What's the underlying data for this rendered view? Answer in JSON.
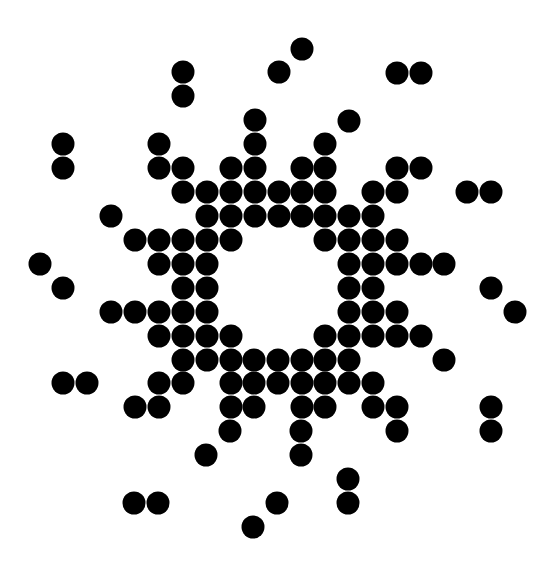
{
  "figure": {
    "width": 554,
    "height": 561,
    "background": "#ffffff",
    "dot_color": "#000000",
    "dot_radius": 11.5
  },
  "dots": [
    [
      302,
      49
    ],
    [
      183,
      72
    ],
    [
      279,
      72
    ],
    [
      397,
      73
    ],
    [
      421,
      73
    ],
    [
      183,
      96
    ],
    [
      255,
      120
    ],
    [
      349,
      121
    ],
    [
      63,
      144
    ],
    [
      159,
      144
    ],
    [
      255,
      144
    ],
    [
      325,
      144
    ],
    [
      63,
      168
    ],
    [
      159,
      168
    ],
    [
      183,
      168
    ],
    [
      231,
      168
    ],
    [
      255,
      168
    ],
    [
      302,
      168
    ],
    [
      325,
      168
    ],
    [
      397,
      168
    ],
    [
      421,
      168
    ],
    [
      183,
      192
    ],
    [
      207,
      192
    ],
    [
      231,
      192
    ],
    [
      255,
      192
    ],
    [
      279,
      192
    ],
    [
      302,
      192
    ],
    [
      325,
      192
    ],
    [
      373,
      192
    ],
    [
      397,
      192
    ],
    [
      467,
      192
    ],
    [
      491,
      192
    ],
    [
      111,
      216
    ],
    [
      207,
      216
    ],
    [
      231,
      216
    ],
    [
      255,
      216
    ],
    [
      279,
      216
    ],
    [
      302,
      216
    ],
    [
      325,
      216
    ],
    [
      349,
      216
    ],
    [
      373,
      216
    ],
    [
      135,
      240
    ],
    [
      159,
      240
    ],
    [
      183,
      240
    ],
    [
      207,
      240
    ],
    [
      231,
      240
    ],
    [
      325,
      240
    ],
    [
      349,
      240
    ],
    [
      373,
      240
    ],
    [
      397,
      240
    ],
    [
      40,
      264
    ],
    [
      159,
      264
    ],
    [
      183,
      264
    ],
    [
      207,
      264
    ],
    [
      349,
      264
    ],
    [
      373,
      264
    ],
    [
      397,
      264
    ],
    [
      421,
      264
    ],
    [
      444,
      264
    ],
    [
      63,
      288
    ],
    [
      183,
      288
    ],
    [
      207,
      288
    ],
    [
      349,
      288
    ],
    [
      373,
      288
    ],
    [
      491,
      288
    ],
    [
      111,
      312
    ],
    [
      135,
      312
    ],
    [
      159,
      312
    ],
    [
      183,
      312
    ],
    [
      207,
      312
    ],
    [
      349,
      312
    ],
    [
      373,
      312
    ],
    [
      397,
      312
    ],
    [
      515,
      312
    ],
    [
      159,
      336
    ],
    [
      183,
      336
    ],
    [
      207,
      336
    ],
    [
      231,
      336
    ],
    [
      325,
      336
    ],
    [
      349,
      336
    ],
    [
      373,
      336
    ],
    [
      397,
      336
    ],
    [
      421,
      336
    ],
    [
      183,
      360
    ],
    [
      207,
      360
    ],
    [
      231,
      360
    ],
    [
      254,
      360
    ],
    [
      278,
      360
    ],
    [
      302,
      360
    ],
    [
      325,
      360
    ],
    [
      349,
      360
    ],
    [
      444,
      360
    ],
    [
      63,
      383
    ],
    [
      87,
      383
    ],
    [
      159,
      383
    ],
    [
      183,
      383
    ],
    [
      231,
      383
    ],
    [
      254,
      383
    ],
    [
      278,
      383
    ],
    [
      302,
      383
    ],
    [
      325,
      383
    ],
    [
      349,
      383
    ],
    [
      373,
      383
    ],
    [
      135,
      407
    ],
    [
      159,
      407
    ],
    [
      231,
      407
    ],
    [
      254,
      407
    ],
    [
      302,
      407
    ],
    [
      325,
      407
    ],
    [
      373,
      407
    ],
    [
      397,
      407
    ],
    [
      491,
      407
    ],
    [
      230,
      431
    ],
    [
      301,
      431
    ],
    [
      397,
      431
    ],
    [
      491,
      431
    ],
    [
      206,
      455
    ],
    [
      301,
      455
    ],
    [
      348,
      479
    ],
    [
      134,
      503
    ],
    [
      158,
      503
    ],
    [
      277,
      503
    ],
    [
      348,
      503
    ],
    [
      253,
      527
    ]
  ]
}
